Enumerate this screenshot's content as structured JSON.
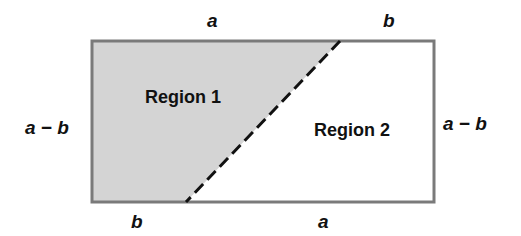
{
  "diagram": {
    "type": "rectangle-partition",
    "colors": {
      "border": "#7a7a7a",
      "shaded_fill": "#d4d4d4",
      "unshaded_fill": "#ffffff",
      "dashed_line": "#111111",
      "text": "#111111"
    },
    "rectangle": {
      "x": 92,
      "y": 41,
      "width": 342,
      "height": 161
    },
    "dashed_line": {
      "x1": 340,
      "y1": 41,
      "x2": 186,
      "y2": 202
    },
    "labels": {
      "top_left": "a",
      "top_right": "b",
      "bottom_left": "b",
      "bottom_right": "a",
      "left_side": "a − b",
      "right_side": "a − b"
    },
    "regions": [
      {
        "name": "Region 1",
        "shaded": true
      },
      {
        "name": "Region 2",
        "shaded": false
      }
    ]
  }
}
